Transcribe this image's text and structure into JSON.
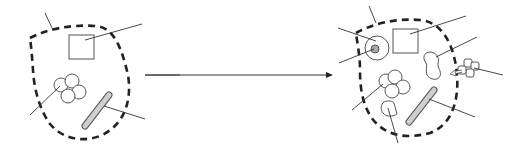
{
  "diagram": {
    "title": "",
    "colors": {
      "background": "#ffffff",
      "membrane": "#222222",
      "outline": "#555555",
      "rod_fill": "#cfcfcf",
      "nucleolus_fill": "#a8a8a8",
      "leader": "#333333"
    },
    "panels": [
      {
        "id": "before",
        "label": "",
        "components": [
          "dashed-membrane",
          "square-organelle",
          "four-circle-cluster",
          "rod-organelle"
        ],
        "leader_line_count": 5
      },
      {
        "id": "after",
        "label": "",
        "components": [
          "dashed-membrane",
          "circle-with-nucleolus",
          "square-organelle",
          "peanut-organelle",
          "four-circle-cluster",
          "rod-organelle",
          "cup-organelle",
          "external-four-square-cluster-entering"
        ],
        "leader_line_count": 9
      }
    ],
    "transition_arrow": {
      "direction": "right",
      "from_x": 145,
      "to_x": 333,
      "y": 75
    },
    "text_labels": []
  }
}
